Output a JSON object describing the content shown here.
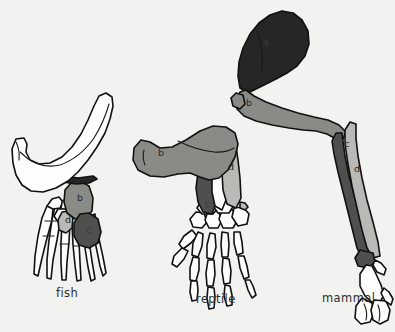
{
  "figure": {
    "background_color": "#f2f2f0",
    "outline_color": "#111111"
  },
  "palette": {
    "bone_white": "#fdfdfb",
    "bone_light_gray": "#b9b9b5",
    "bone_mid_gray": "#8a8a86",
    "bone_dark_gray": "#4f4f4d",
    "bone_black": "#262626",
    "caption_text": "#2e2e2e"
  },
  "legend_keys": {
    "a": "a",
    "b": "b",
    "c": "c",
    "d": "d"
  },
  "specimens": [
    {
      "id": "fish",
      "caption": "fish",
      "caption_x": 56,
      "caption_y": 297,
      "bone_labels": [
        {
          "key": "b",
          "x": 80,
          "y": 201,
          "shade": "mid"
        },
        {
          "key": "d",
          "x": 68,
          "y": 223,
          "shade": "light"
        },
        {
          "key": "c",
          "x": 88,
          "y": 233,
          "shade": "dark"
        }
      ]
    },
    {
      "id": "reptile",
      "caption": "reptile",
      "caption_x": 196,
      "caption_y": 303,
      "bone_labels": [
        {
          "key": "b",
          "x": 161,
          "y": 156,
          "shade": "mid"
        },
        {
          "key": "c",
          "x": 208,
          "y": 207,
          "shade": "dark"
        },
        {
          "key": "d",
          "x": 231,
          "y": 170,
          "shade": "light"
        }
      ]
    },
    {
      "id": "mammal",
      "caption": "mammal",
      "caption_x": 322,
      "caption_y": 302,
      "bone_labels": [
        {
          "key": "a",
          "x": 266,
          "y": 45,
          "shade": "black"
        },
        {
          "key": "b",
          "x": 249,
          "y": 106,
          "shade": "mid"
        },
        {
          "key": "c",
          "x": 347,
          "y": 147,
          "shade": "dark"
        },
        {
          "key": "d",
          "x": 357,
          "y": 172,
          "shade": "light"
        }
      ]
    }
  ]
}
